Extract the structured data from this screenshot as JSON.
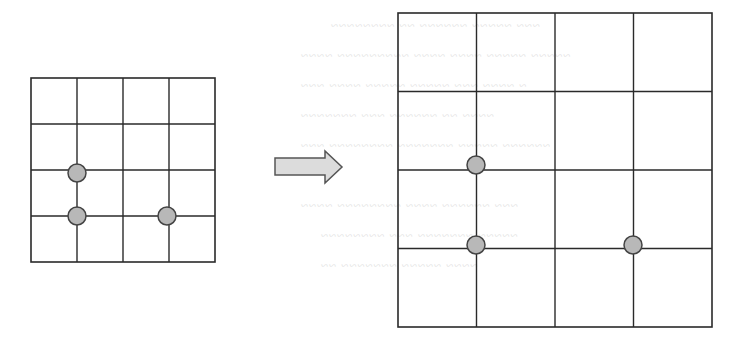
{
  "diagram": {
    "left_grid": {
      "rows": 4,
      "cols": 4,
      "origin": [
        31,
        78
      ],
      "cell": 46,
      "dots": [
        {
          "col": 1,
          "row": 2,
          "cx": 77,
          "cy": 173
        },
        {
          "col": 1,
          "row": 3,
          "cx": 77,
          "cy": 216
        },
        {
          "col": 3,
          "row": 3,
          "cx": 167,
          "cy": 216
        }
      ]
    },
    "arrow": {
      "direction": "right",
      "fill": "#dcdcdc",
      "stroke": "#555555"
    },
    "right_grid": {
      "rows": 4,
      "cols": 4,
      "origin": [
        398,
        13
      ],
      "cell": 78.5,
      "dots": [
        {
          "col": 1,
          "row": 2,
          "cx": 476,
          "cy": 165
        },
        {
          "col": 1,
          "row": 3,
          "cx": 476,
          "cy": 245
        },
        {
          "col": 3,
          "row": 3,
          "cx": 633,
          "cy": 245
        }
      ]
    },
    "colors": {
      "grid_line": "#2a2a2a",
      "dot_fill": "#b8b8b8",
      "dot_stroke": "#444444",
      "background": "#ffffff"
    }
  }
}
